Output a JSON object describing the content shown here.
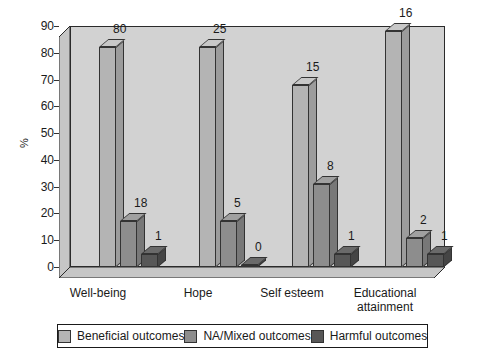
{
  "chart_data": {
    "type": "bar",
    "title": "",
    "xlabel": "",
    "ylabel": "%",
    "ylim": [
      0,
      90
    ],
    "yticks": [
      "0",
      "10",
      "20",
      "30",
      "40",
      "50",
      "60",
      "70",
      "80",
      "90"
    ],
    "grid": false,
    "legend_position": "bottom",
    "style": "3d-bar",
    "categories": [
      "Well-being",
      "Hope",
      "Self esteem",
      "Educational attainment"
    ],
    "series": [
      {
        "name": "Beneficial outcomes",
        "color": "#b4b4b4",
        "values": [
          82,
          82,
          68,
          88
        ],
        "labels": [
          "80",
          "25",
          "15",
          "16"
        ]
      },
      {
        "name": "NA/Mixed outcomes",
        "color": "#8d8d8d",
        "values": [
          17,
          17,
          31,
          11
        ],
        "labels": [
          "18",
          "5",
          "8",
          "2"
        ]
      },
      {
        "name": "Harmful outcomes",
        "color": "#575757",
        "values": [
          5,
          0,
          5,
          5
        ],
        "labels": [
          "1",
          "0",
          "1",
          "1"
        ]
      }
    ]
  },
  "axis": {
    "y_title": "%",
    "ticks": [
      "90",
      "80",
      "70",
      "60",
      "50",
      "40",
      "30",
      "20",
      "10",
      "0"
    ]
  },
  "categories": [
    {
      "line1": "Well-being",
      "line2": ""
    },
    {
      "line1": "Hope",
      "line2": ""
    },
    {
      "line1": "Self esteem",
      "line2": ""
    },
    {
      "line1": "Educational",
      "line2": "attainment"
    }
  ],
  "legend": {
    "items": [
      {
        "label": "Beneficial outcomes",
        "color": "#b4b4b4"
      },
      {
        "label": "NA/Mixed outcomes",
        "color": "#8d8d8d"
      },
      {
        "label": "Harmful outcomes",
        "color": "#575757"
      }
    ]
  }
}
